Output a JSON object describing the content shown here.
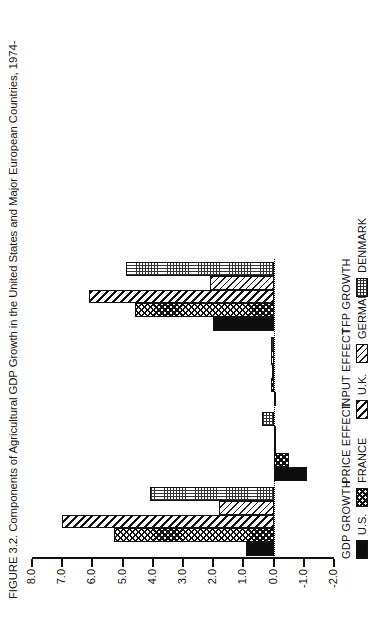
{
  "page": {
    "folio": "34"
  },
  "figure": {
    "title": "FIGURE 3.2. Components of Agricultural GDP Growth in the United States and Major European Countries, 1974-"
  },
  "chart_data": {
    "type": "bar",
    "title": "FIGURE 3.2. Components of Agricultural GDP Growth in the United States and Major European Countries, 1974-",
    "orientation": "vertical-grouped",
    "categories": [
      "GDP GROWTH",
      "PRICE EFFECT",
      "INPUT EFFECT",
      "TFP GROWTH"
    ],
    "series": [
      {
        "name": "U.S.",
        "pattern": "solid-black",
        "values": [
          0.9,
          -1.1,
          0.0,
          2.0
        ]
      },
      {
        "name": "FRANCE",
        "pattern": "cross-hatch",
        "values": [
          5.3,
          -0.5,
          0.1,
          4.6
        ]
      },
      {
        "name": "U.K.",
        "pattern": "diagonal-hatch",
        "values": [
          7.0,
          0.0,
          0.05,
          6.1
        ]
      },
      {
        "name": "GERMANY",
        "pattern": "light-diagonal",
        "values": [
          1.8,
          0.0,
          0.1,
          2.1
        ]
      },
      {
        "name": "DENMARK",
        "pattern": "fine-dot-grid",
        "values": [
          4.1,
          0.4,
          0.1,
          4.9
        ]
      }
    ],
    "ylabel": "",
    "xlabel": "",
    "ylim": [
      -2.0,
      8.0
    ],
    "ytick_labels": [
      "8.0",
      "7.0",
      "6.0",
      "5.0",
      "4.0",
      "3.0",
      "2.0",
      "1.0",
      "0.0",
      "-1.0",
      "-2.0"
    ],
    "ytick_values": [
      8.0,
      7.0,
      6.0,
      5.0,
      4.0,
      3.0,
      2.0,
      1.0,
      0.0,
      -1.0,
      -2.0
    ],
    "grid": false,
    "zero_reference_line": true,
    "legend_position": "below-axis"
  },
  "legend": {
    "entries": [
      {
        "label": "U.S.",
        "swatch": "solid-black-swatch"
      },
      {
        "label": "FRANCE",
        "swatch": "cross-hatch-swatch"
      },
      {
        "label": "U.K.",
        "swatch": "diagonal-hatch-swatch"
      },
      {
        "label": "GERMANY",
        "swatch": "light-diagonal-swatch"
      },
      {
        "label": "DENMARK",
        "swatch": "fine-dot-grid-swatch"
      }
    ]
  },
  "colors": {
    "ink": "#111111",
    "paper": "#ffffff"
  }
}
